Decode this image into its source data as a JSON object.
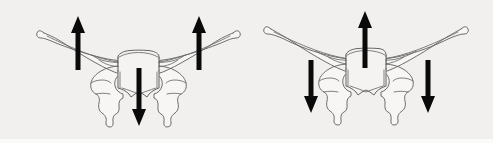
{
  "figure": {
    "background_color": "#f1f0ee",
    "outline_color": "#5d5d5d",
    "outline_fill": "#f7f6f5",
    "arrow_color": "#0a0a0a",
    "panel_count": 2
  },
  "panels": [
    {
      "id": "panel-left",
      "name": "left-sphenoid-diagram",
      "label": "",
      "arrows": [
        {
          "id": "left-panel-left-wing-arrow",
          "name": "left-wing-up-arrow",
          "direction": "up",
          "label": "",
          "tip_x": 78,
          "tip_y": 16,
          "tail_x": 78,
          "tail_y": 70,
          "shaft_width": 5.0,
          "head_width": 14,
          "head_length": 17,
          "color": "#0a0a0a"
        },
        {
          "id": "left-panel-right-wing-arrow",
          "name": "right-wing-up-arrow",
          "direction": "up",
          "label": "",
          "tip_x": 199,
          "tip_y": 16,
          "tail_x": 199,
          "tail_y": 70,
          "shaft_width": 5.0,
          "head_width": 14,
          "head_length": 17,
          "color": "#0a0a0a"
        },
        {
          "id": "left-panel-body-arrow",
          "name": "body-down-arrow",
          "direction": "down",
          "label": "",
          "tip_x": 139,
          "tip_y": 126,
          "tail_x": 139,
          "tail_y": 68,
          "shaft_width": 5.0,
          "head_width": 14,
          "head_length": 17,
          "color": "#0a0a0a"
        }
      ]
    },
    {
      "id": "panel-right",
      "name": "right-sphenoid-diagram",
      "label": "",
      "arrows": [
        {
          "id": "right-panel-body-arrow",
          "name": "body-up-arrow",
          "direction": "up",
          "label": "",
          "tip_x": 365,
          "tip_y": 11,
          "tail_x": 365,
          "tail_y": 68,
          "shaft_width": 5.0,
          "head_width": 14,
          "head_length": 17,
          "color": "#0a0a0a"
        },
        {
          "id": "right-panel-left-wing-arrow",
          "name": "left-wing-down-arrow",
          "direction": "down",
          "label": "",
          "tip_x": 311,
          "tip_y": 113,
          "tail_x": 311,
          "tail_y": 60,
          "shaft_width": 5.0,
          "head_width": 14,
          "head_length": 17,
          "color": "#0a0a0a"
        },
        {
          "id": "right-panel-right-wing-arrow",
          "name": "right-wing-down-arrow",
          "direction": "down",
          "label": "",
          "tip_x": 428,
          "tip_y": 113,
          "tail_x": 428,
          "tail_y": 60,
          "shaft_width": 5.0,
          "head_width": 14,
          "head_length": 17,
          "color": "#0a0a0a"
        }
      ]
    }
  ],
  "annotations": {
    "caption": "",
    "visible_text": []
  }
}
